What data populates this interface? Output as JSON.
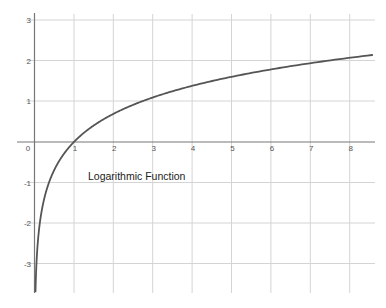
{
  "chart_data": {
    "type": "line",
    "title": "",
    "annotation": "Logarithmic Function",
    "xlabel": "",
    "ylabel": "",
    "function": "y = ln(x)",
    "xlim": [
      0,
      8.6
    ],
    "ylim": [
      -3.7,
      3.2
    ],
    "grid": true,
    "legend": null,
    "x_ticks": [
      0,
      1,
      2,
      3,
      4,
      5,
      6,
      7,
      8
    ],
    "y_ticks": [
      -3,
      -2,
      -1,
      1,
      2,
      3
    ],
    "series": [
      {
        "name": "Logarithmic Function",
        "color": "#555555",
        "x": [
          0.025,
          0.05,
          0.1,
          0.2,
          0.3,
          0.5,
          0.75,
          1,
          1.5,
          2,
          3,
          4,
          5,
          6,
          7,
          8,
          8.57
        ],
        "y": [
          -3.69,
          -3.0,
          -2.3,
          -1.61,
          -1.2,
          -0.69,
          -0.29,
          0,
          0.41,
          0.69,
          1.1,
          1.39,
          1.61,
          1.79,
          1.95,
          2.08,
          2.15
        ]
      }
    ]
  },
  "labels": {
    "annotation": "Logarithmic Function",
    "x_ticks": [
      "0",
      "1",
      "2",
      "3",
      "4",
      "5",
      "6",
      "7",
      "8"
    ],
    "y_ticks": [
      "3",
      "2",
      "1",
      "-1",
      "-2",
      "-3"
    ]
  },
  "colors": {
    "curve": "#555555",
    "grid": "#d4d4d4",
    "axis": "#777777",
    "background": "#ffffff"
  }
}
